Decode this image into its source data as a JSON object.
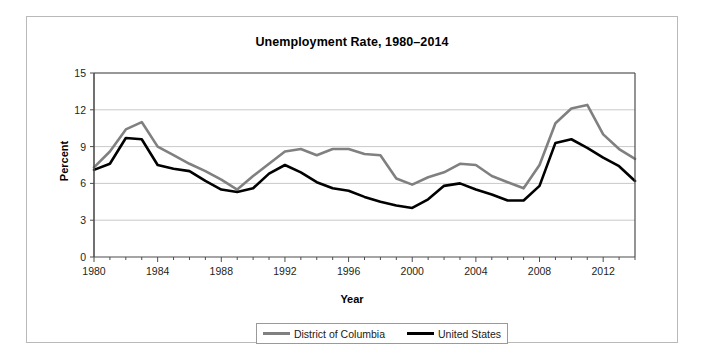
{
  "figure": {
    "title": "Unemployment Rate, 1980–2014",
    "xlabel": "Year",
    "ylabel": "Percent"
  },
  "legend": {
    "entries": [
      {
        "label": "District of Columbia",
        "color": "#808080"
      },
      {
        "label": "United States",
        "color": "#000000"
      }
    ]
  },
  "chart_data": {
    "type": "line",
    "title": "Unemployment Rate, 1980–2014",
    "xlabel": "Year",
    "ylabel": "Percent",
    "xlim": [
      1980,
      2014
    ],
    "ylim": [
      0,
      15
    ],
    "yticks": [
      0,
      3,
      6,
      9,
      12,
      15
    ],
    "xticks": [
      1980,
      1984,
      1988,
      1992,
      1996,
      2000,
      2004,
      2008,
      2012
    ],
    "grid": "horizontal",
    "legend_position": "bottom",
    "x": [
      1980,
      1981,
      1982,
      1983,
      1984,
      1985,
      1986,
      1987,
      1988,
      1989,
      1990,
      1991,
      1992,
      1993,
      1994,
      1995,
      1996,
      1997,
      1998,
      1999,
      2000,
      2001,
      2002,
      2003,
      2004,
      2005,
      2006,
      2007,
      2008,
      2009,
      2010,
      2011,
      2012,
      2013,
      2014
    ],
    "series": [
      {
        "name": "District of Columbia",
        "color": "#808080",
        "values": [
          7.3,
          8.6,
          10.4,
          11.0,
          9.0,
          8.3,
          7.6,
          7.0,
          6.3,
          5.5,
          6.6,
          7.6,
          8.6,
          8.8,
          8.3,
          8.8,
          8.8,
          8.4,
          8.3,
          6.4,
          5.9,
          6.5,
          6.9,
          7.6,
          7.5,
          6.6,
          6.1,
          5.6,
          7.5,
          10.9,
          12.1,
          12.4,
          10.0,
          8.8,
          8.0
        ]
      },
      {
        "name": "United States",
        "color": "#000000",
        "values": [
          7.1,
          7.6,
          9.7,
          9.6,
          7.5,
          7.2,
          7.0,
          6.2,
          5.5,
          5.3,
          5.6,
          6.8,
          7.5,
          6.9,
          6.1,
          5.6,
          5.4,
          4.9,
          4.5,
          4.2,
          4.0,
          4.7,
          5.8,
          6.0,
          5.5,
          5.1,
          4.6,
          4.6,
          5.8,
          9.3,
          9.6,
          8.9,
          8.1,
          7.4,
          6.2
        ]
      }
    ]
  }
}
